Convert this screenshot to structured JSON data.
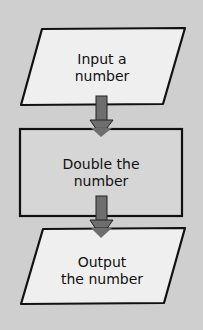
{
  "diagram": {
    "type": "flowchart",
    "colors": {
      "background": "#cfcfcf",
      "shape_fill": "#efefef",
      "rect_fill": "#d6d6d6",
      "outline": "#111111",
      "arrow": "#6e6e6e"
    },
    "nodes": [
      {
        "id": "input",
        "shape": "parallelogram",
        "line1": "Input a",
        "line2": "number"
      },
      {
        "id": "process",
        "shape": "rectangle",
        "line1": "Double the",
        "line2": "number"
      },
      {
        "id": "output",
        "shape": "parallelogram",
        "line1": "Output",
        "line2": "the number"
      }
    ],
    "edges": [
      {
        "from": "input",
        "to": "process"
      },
      {
        "from": "process",
        "to": "output"
      }
    ]
  }
}
